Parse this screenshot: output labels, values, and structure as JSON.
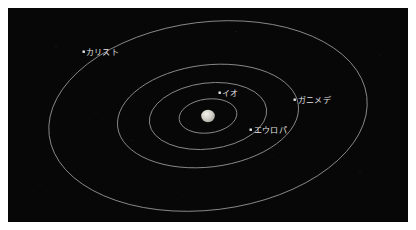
{
  "figure": {
    "kind": "orbit-diagram",
    "background_color": "#070707",
    "border_color": "#ffffff",
    "orbit_color": "#8f8f8f",
    "label_color": "#e2e2e2"
  },
  "center_body": {
    "name": "jupiter",
    "label": "",
    "color": "#d8d6d0",
    "cx": 200,
    "cy": 108,
    "r": 6.5
  },
  "orbits": [
    {
      "id": "io",
      "label": "イオ",
      "rx": 29,
      "ry": 17,
      "rotation": -7,
      "dot": {
        "x": 212,
        "y": 85
      },
      "label_pos": {
        "x": 216,
        "y": 88
      }
    },
    {
      "id": "europa",
      "label": "エウロパ",
      "rx": 59,
      "ry": 33,
      "rotation": -7,
      "dot": {
        "x": 243,
        "y": 122
      },
      "label_pos": {
        "x": 248,
        "y": 126
      }
    },
    {
      "id": "ganymede",
      "label": "ガニメデ",
      "rx": 91,
      "ry": 51,
      "rotation": -7,
      "dot": {
        "x": 287,
        "y": 92
      },
      "label_pos": {
        "x": 292,
        "y": 96
      }
    },
    {
      "id": "callisto",
      "label": "カリスト",
      "rx": 160,
      "ry": 94,
      "rotation": -7,
      "dot": {
        "x": 76,
        "y": 44
      },
      "label_pos": {
        "x": 80,
        "y": 48
      }
    }
  ]
}
